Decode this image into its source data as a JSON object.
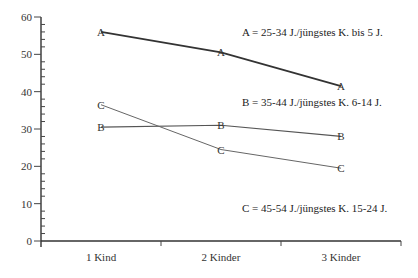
{
  "chart_data": {
    "type": "line",
    "title": "",
    "xlabel": "",
    "ylabel": "",
    "ylim": [
      0,
      60
    ],
    "yticks": [
      0,
      10,
      20,
      30,
      40,
      50,
      60
    ],
    "yminor_step": 2,
    "grid": false,
    "categories": [
      "1 Kind",
      "2 Kinder",
      "3 Kinder"
    ],
    "series": [
      {
        "name": "A",
        "marker": "A",
        "legend": "A = 25-34 J./jüngstes K. bis 5 J.",
        "values": [
          56,
          50.5,
          41.5
        ],
        "color": "#333333",
        "width": 1.8
      },
      {
        "name": "B",
        "marker": "B",
        "legend": "B = 35-44 J./jüngstes K. 6-14 J.",
        "values": [
          30.5,
          31,
          28
        ],
        "color": "#555555",
        "width": 1.2
      },
      {
        "name": "C",
        "marker": "C",
        "legend": "C = 45-54 J./jüngstes K. 15-24 J.",
        "values": [
          36.5,
          24.5,
          19.5
        ],
        "color": "#666666",
        "width": 1.0
      }
    ],
    "legend_position": "right, inline near each series"
  }
}
